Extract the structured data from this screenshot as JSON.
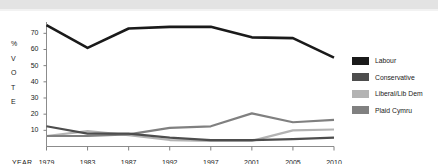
{
  "chart_data": {
    "type": "line",
    "title": "",
    "xlabel": "YEAR",
    "ylabel": "% VOTE",
    "categories": [
      "1979",
      "1983",
      "1987",
      "1992",
      "1997",
      "2001",
      "2005",
      "2010"
    ],
    "ylim": [
      0,
      77
    ],
    "yticks": [
      "10",
      "20",
      "30",
      "40",
      "50",
      "60",
      "70"
    ],
    "grid": false,
    "legend_position": "right",
    "series": [
      {
        "name": "Labour",
        "color": "#1a1a1a",
        "values": [
          75,
          61,
          73,
          74,
          74,
          67.5,
          67,
          55
        ]
      },
      {
        "name": "Conservative",
        "color": "#4d4d4d",
        "values": [
          12.5,
          8,
          8,
          5.5,
          4,
          4,
          4.5,
          5.5
        ]
      },
      {
        "name": "Liberal/Lib Dem",
        "color": "#b3b3b3",
        "values": [
          6.5,
          9.5,
          7,
          4,
          3.5,
          3.5,
          10,
          10.5
        ]
      },
      {
        "name": "Plaid Cymru",
        "color": "#808080",
        "values": [
          6.5,
          6.5,
          7.5,
          11.5,
          12.5,
          20.5,
          15,
          16.5
        ]
      }
    ]
  },
  "axis": {
    "year_label": "YEAR",
    "vote_letters": [
      "%",
      "V",
      "O",
      "T",
      "E"
    ]
  },
  "colors": {
    "labour": "#1a1a1a",
    "conservative": "#4d4d4d",
    "liberal": "#b3b3b3",
    "plaid": "#808080",
    "axis": "#808080",
    "banner": "#e3e3e3"
  }
}
